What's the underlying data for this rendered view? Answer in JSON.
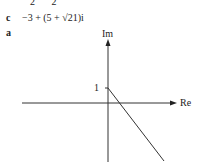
{
  "top_fragment": "2  2",
  "parts": [
    {
      "label": "c",
      "expression": "−3 + (5 + √21)i"
    },
    {
      "label": "a"
    }
  ],
  "diagram": {
    "type": "argand",
    "y_axis_label": "Im",
    "x_axis_label": "Re",
    "tick_label": "1",
    "line": {
      "from": [
        0,
        1
      ],
      "direction": "down-right through positive real axis"
    }
  }
}
